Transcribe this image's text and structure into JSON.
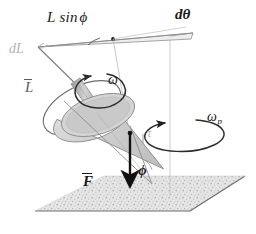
{
  "figure": {
    "background": "#ffffff",
    "labels": {
      "l_sin_phi": "L sin",
      "l_sin_phi_symbol": "ϕ",
      "d_theta": "dθ",
      "dl": "dL",
      "l_vector": "L",
      "omega": "ω",
      "omega_p": "ω",
      "omega_p_sub": "p",
      "tau": "τ",
      "phi": "ϕ",
      "f_vector": "F"
    },
    "colors": {
      "ink": "#1a1a1a",
      "mid_gray": "#5c5c5c",
      "light_gray": "#9a9a9a",
      "faint_gray": "#b4b4b4",
      "cone_fill": "#cfcfcf",
      "cone_stroke": "#8d8d8d",
      "ground_fill": "#d9d9d9",
      "ground_stroke": "#6e6e6e",
      "wedge_fill": "#e8e8e8",
      "shaft_fill": "#b8b8b8"
    },
    "elements": [
      {
        "name": "ground-plane",
        "kind": "parallelogram-stippled"
      },
      {
        "name": "cone-body",
        "kind": "tilted-cone"
      },
      {
        "name": "spin-axis-shaft",
        "kind": "rod"
      },
      {
        "name": "spin-circle-omega",
        "kind": "ellipse-arrow"
      },
      {
        "name": "precession-circle-omega-p",
        "kind": "ellipse-arrow"
      },
      {
        "name": "angular-momentum-circle",
        "kind": "ellipse"
      },
      {
        "name": "dl-wedge",
        "kind": "thin-triangle"
      },
      {
        "name": "force-arrow",
        "kind": "bold-down-arrow"
      },
      {
        "name": "torque-tick",
        "kind": "short-line"
      },
      {
        "name": "vertical-reference-line",
        "kind": "line"
      },
      {
        "name": "d-theta-angle-arc",
        "kind": "arc"
      }
    ]
  }
}
